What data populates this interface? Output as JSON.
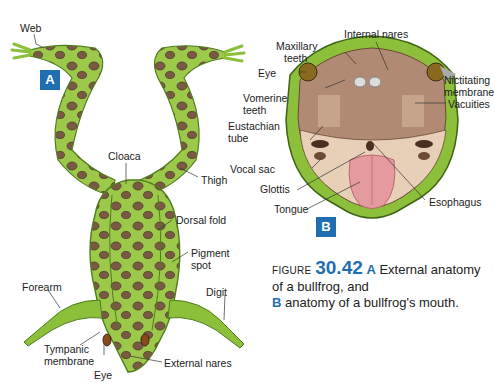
{
  "figure": {
    "label_word": "Figure",
    "number": "30.42",
    "caption_part_a_key": "A",
    "caption_part_a_text": "External anatomy of a bullfrog, and",
    "caption_part_b_key": "B",
    "caption_part_b_text": "anatomy of a bullfrog's mouth."
  },
  "panel_a": {
    "badge": "A",
    "labels": {
      "web": "Web",
      "cloaca": "Cloaca",
      "thigh": "Thigh",
      "dorsal_fold": "Dorsal fold",
      "pigment_spot_1": "Pigment",
      "pigment_spot_2": "spot",
      "forearm": "Forearm",
      "digit": "Digit",
      "tympanic_membrane_1": "Tympanic",
      "tympanic_membrane_2": "membrane",
      "eye": "Eye",
      "external_nares": "External nares"
    }
  },
  "panel_b": {
    "badge": "B",
    "labels": {
      "internal_nares": "Internal nares",
      "maxillary_teeth_1": "Maxillary",
      "maxillary_teeth_2": "teeth",
      "eye": "Eye",
      "nictitating_membrane_1": "Nictitating",
      "nictitating_membrane_2": "membrane",
      "vomerine_teeth_1": "Vomerine",
      "vomerine_teeth_2": "teeth",
      "vacuities": "Vacuities",
      "eustachian_tube_1": "Eustachian",
      "eustachian_tube_2": "tube",
      "vocal_sac": "Vocal sac",
      "glottis": "Glottis",
      "tongue": "Tongue",
      "esophagus": "Esophagus"
    }
  },
  "colors": {
    "accent_blue": "#1f6fb0",
    "frog_green": "#8cbf3a",
    "frog_dark_green": "#4f7d1c",
    "spot_brown": "#7a5a44",
    "mouth_tan": "#b08a72",
    "tongue_pink": "#e59aa0"
  }
}
